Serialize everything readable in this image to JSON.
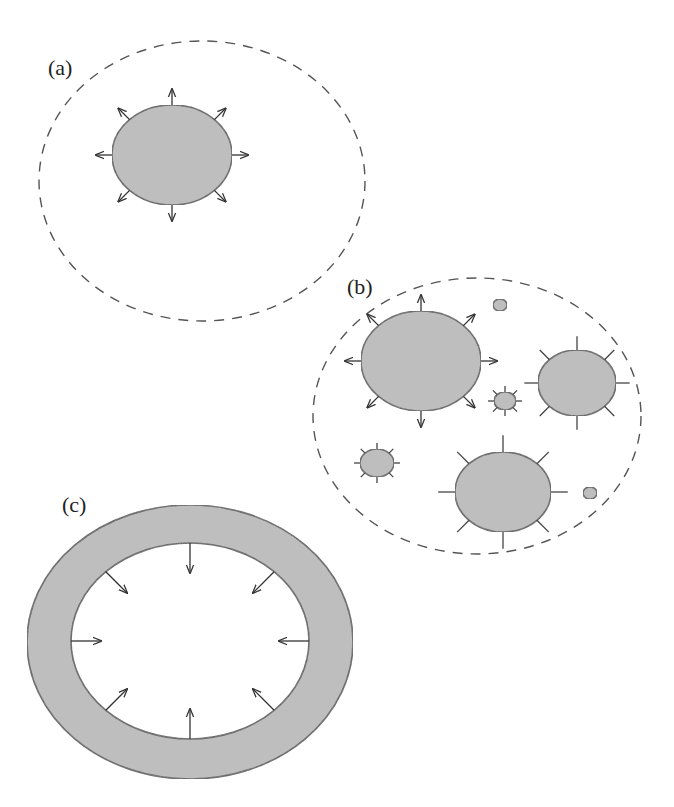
{
  "figure": {
    "panels": [
      {
        "id": "a",
        "label": "(a)",
        "label_pos": [
          48,
          75
        ],
        "boundary": {
          "cx": 202,
          "cy": 181,
          "rx": 163,
          "ry": 140,
          "style": "dashed"
        },
        "particles": [
          {
            "cx": 172,
            "cy": 155,
            "rx": 60,
            "ry": 50,
            "marks": "arrows-out"
          }
        ]
      },
      {
        "id": "b",
        "label": "(b)",
        "label_pos": [
          347,
          294
        ],
        "boundary": {
          "cx": 477,
          "cy": 416,
          "rx": 164,
          "ry": 138,
          "style": "dashed"
        },
        "particles": [
          {
            "cx": 421,
            "cy": 361,
            "rx": 60,
            "ry": 50,
            "marks": "arrows-out"
          },
          {
            "cx": 577,
            "cy": 383,
            "rx": 39,
            "ry": 33,
            "marks": "ticks"
          },
          {
            "cx": 503,
            "cy": 492,
            "rx": 48,
            "ry": 40,
            "marks": "ticks"
          },
          {
            "cx": 377,
            "cy": 463,
            "rx": 17,
            "ry": 14,
            "marks": "ticks"
          },
          {
            "cx": 505,
            "cy": 401,
            "rx": 11,
            "ry": 9,
            "marks": "ticks"
          },
          {
            "cx": 500,
            "cy": 305,
            "rx": 7,
            "ry": 6,
            "marks": "dot"
          },
          {
            "cx": 590,
            "cy": 493,
            "rx": 7,
            "ry": 6,
            "marks": "dot"
          }
        ]
      },
      {
        "id": "c",
        "label": "(c)",
        "label_pos": [
          62,
          512
        ],
        "ring": {
          "outer": {
            "cx": 190,
            "cy": 642,
            "rx": 163,
            "ry": 137
          },
          "inner": {
            "cx": 190,
            "cy": 641,
            "rx": 119,
            "ry": 98
          }
        },
        "marks": "arrows-in"
      }
    ],
    "colors": {
      "fill": "#bdbdbd",
      "stroke": "#555555",
      "background": "#ffffff"
    }
  }
}
